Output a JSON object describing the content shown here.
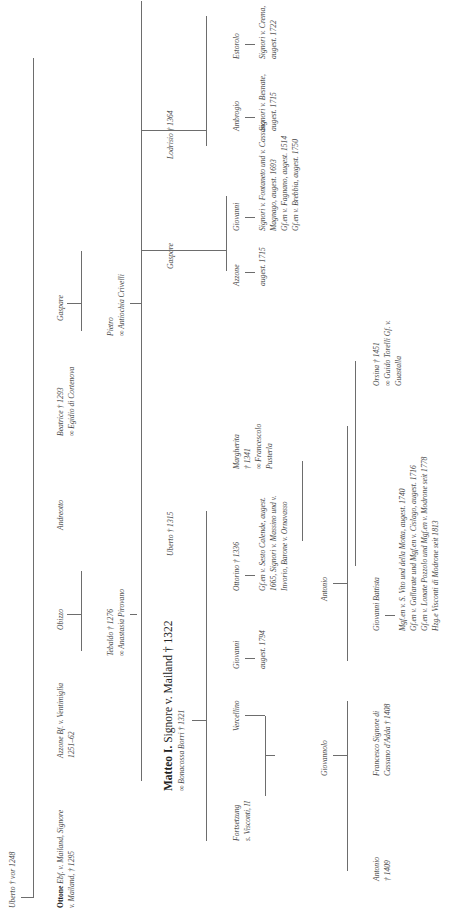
{
  "persons": {
    "uberto_root": "Uberto † vor 1248",
    "ottone_name": "Ottone",
    "ottone_desc1": "Ebf. v. Mailand, Signore",
    "ottone_desc2": "v. Mailand, † 1295",
    "azzone_bf1": "Azzone Bf. v. Ventimiglia",
    "azzone_bf2": "1251–62",
    "obizzo": "Obizzo",
    "andreotto": "Andreotto",
    "beatrice1": "Beatrice † 1293",
    "beatrice2": "∞ Egidio di Cortenova",
    "gaspare1": "Gaspare",
    "tebaldo1": "Tebaldo † 1276",
    "tebaldo2": "∞ Anastasia Pirovano",
    "pietro1": "Pietro",
    "pietro2": "∞ Antiochia Crivelli",
    "matteo_name": "Matteo I.",
    "matteo_desc": "Signore v. Mailand † 1322",
    "matteo_spouse": "∞ Bonacossa Borri † 1321",
    "uberto2": "Uberto † 1315",
    "gaspare2": "Gaspare",
    "lodrisio": "Lodrisio † 1364",
    "fortsetzung1": "Fortsetzung",
    "fortsetzung2": "s. Visconti, II",
    "vercellino": "Vercellino",
    "giovanni1": "Giovanni",
    "giovanni1_desc": "augest. 1794",
    "ottorino1": "Ottorino † 1336",
    "ottorino_desc1": "Gf.en v. Sesto Calende, augest.",
    "ottorino_desc2": "1665, Signori v. Massino und v.",
    "ottorino_desc3": "Invorio, Barone v. Ornavasso",
    "margherita1": "Margherita",
    "margherita2": "† 1341",
    "margherita3": "∞ Francescolo",
    "margherita4": "Pusterla",
    "azzone2": "Azzone",
    "azzone2_desc": "augest. 1715",
    "giovanni2": "Giovanni",
    "giovanni2_desc1": "Signori v. Fontaneto und v. Cassano",
    "giovanni2_desc2": "Magnago, augest. 1693",
    "giovanni2_desc3": "Gf.en v. Fagnano, augest. 1514",
    "giovanni2_desc4": "Gf.en v. Brebbia, augest. 1750",
    "ambrogio": "Ambrogio",
    "ambrogio_desc1": "Signori v. Besnate,",
    "ambrogio_desc2": "augest. 1715",
    "estorolo": "Estorolo",
    "estorolo_desc1": "Signori v. Crema,",
    "estorolo_desc2": "augest. 1722",
    "giovannolo": "Giovannolo",
    "antonio_mid": "Antonio",
    "antonio1": "Antonio",
    "antonio2": "† 1409",
    "francesco1": "Francesco Signore di",
    "francesco2": "Cassano d'Adda † 1408",
    "giov_battista": "Giovanni Battista",
    "gb_desc1": "Mgf.en v. S. Vito und della Motta, augest. 1740",
    "gb_desc2": "Gf.en v. Gallarate und Mgf.en v. Cislago, augest. 1716",
    "gb_desc3": "Gf.en v. Lonate Pozzolo und Mgf.en v. Modrone seit 1778",
    "gb_desc4": "Hzg.e Visconti di Modrone seit 1813",
    "orsina1": "Orsina † 1451",
    "orsina2": "∞ Guido Torelli Gf. v.",
    "orsina3": "Guastalla"
  }
}
